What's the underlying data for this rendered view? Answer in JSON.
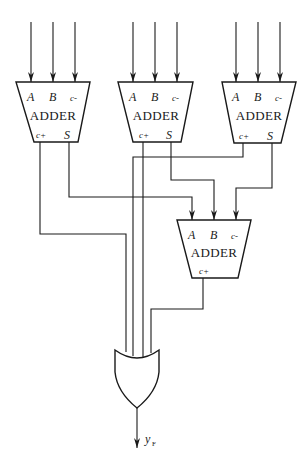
{
  "diagram": {
    "adders": [
      {
        "id": "adder-1",
        "title": "ADDER",
        "inputs": [
          "A",
          "B",
          "c-"
        ],
        "outputs": [
          "c+",
          "S"
        ]
      },
      {
        "id": "adder-2",
        "title": "ADDER",
        "inputs": [
          "A",
          "B",
          "c-"
        ],
        "outputs": [
          "c+",
          "S"
        ]
      },
      {
        "id": "adder-3",
        "title": "ADDER",
        "inputs": [
          "A",
          "B",
          "c-"
        ],
        "outputs": [
          "c+",
          "S"
        ]
      },
      {
        "id": "adder-4",
        "title": "ADDER",
        "inputs": [
          "A",
          "B",
          "c-"
        ],
        "outputs": [
          "c+"
        ]
      }
    ],
    "or_gate": {
      "inputs": 4
    },
    "output": {
      "label": "y",
      "subscript": "F"
    }
  }
}
